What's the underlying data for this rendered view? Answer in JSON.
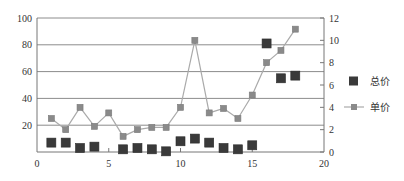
{
  "chart_data": {
    "type": "line",
    "title": "",
    "xlabel": "",
    "ylabel": "",
    "y2label": "",
    "xlim": [
      0,
      20
    ],
    "ylim": [
      0,
      100
    ],
    "y2lim": [
      0,
      12
    ],
    "x_ticks": [
      0,
      5,
      10,
      15,
      20
    ],
    "y_ticks": [
      20,
      40,
      60,
      80,
      100
    ],
    "y2_ticks": [
      0,
      2,
      4,
      6,
      8,
      10,
      12
    ],
    "grid": true,
    "legend_position": "right",
    "series": [
      {
        "name": "总价",
        "axis": "left",
        "style": "markers",
        "marker": "square",
        "color": "#3a3a3a",
        "x": [
          1,
          2,
          3,
          4,
          6,
          7,
          8,
          9,
          10,
          11,
          12,
          13,
          14,
          15,
          16,
          17,
          18
        ],
        "values": [
          7,
          7,
          3,
          4,
          2,
          3,
          2,
          0.5,
          8,
          10,
          7,
          3,
          2,
          5,
          81,
          55,
          57
        ]
      },
      {
        "name": "单价",
        "axis": "right",
        "style": "line+markers",
        "marker": "square",
        "color": "#8a8a8a",
        "line_color": "#aaaaaa",
        "x": [
          1,
          2,
          3,
          4,
          5,
          6,
          7,
          8,
          9,
          10,
          11,
          12,
          13,
          14,
          15,
          16,
          17,
          18
        ],
        "values": [
          3.0,
          2.0,
          4.0,
          2.3,
          3.5,
          1.4,
          2.0,
          2.2,
          2.2,
          4.0,
          10.0,
          3.5,
          3.9,
          3.0,
          5.1,
          8.0,
          9.1,
          11.0
        ]
      }
    ]
  }
}
